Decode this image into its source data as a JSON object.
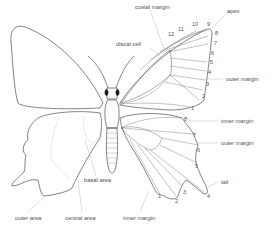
{
  "diagram": {
    "labels": {
      "costal_margin": "costal margin",
      "apex": "apex",
      "discal_cell": "discal cell",
      "outer_margin_fore": "outer margin",
      "inner_margin_fore": "inner margin",
      "outer_margin_hind": "outer margin",
      "tail": "tail",
      "basal_area": "basal area",
      "outer_area": "outer area",
      "central_area": "central area",
      "inner_margin_hind": "inner margin"
    },
    "forewing_veins": [
      "1",
      "2",
      "3",
      "4",
      "5",
      "6",
      "7",
      "8",
      "9",
      "10",
      "11",
      "12"
    ],
    "hindwing_veins": [
      "1",
      "2",
      "3",
      "4",
      "5",
      "6",
      "7",
      "8"
    ],
    "colors": {
      "outline": "#333333",
      "leader": "#aaaaaa",
      "label": "#555555",
      "dashed": "#999999"
    }
  }
}
